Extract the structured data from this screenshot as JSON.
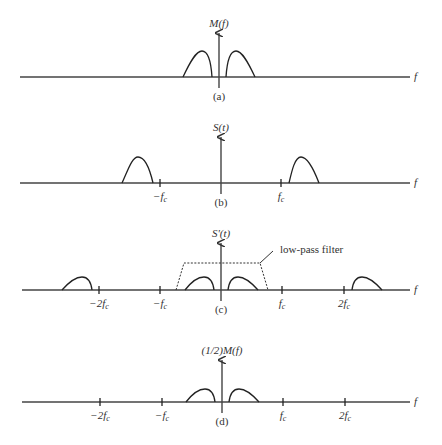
{
  "figure": {
    "panels": [
      {
        "id": "a",
        "caption": "(a)",
        "ylabel": "M(f)",
        "xlabel": "f",
        "ticks": []
      },
      {
        "id": "b",
        "caption": "(b)",
        "ylabel": "S(t)",
        "xlabel": "f",
        "ticks": [
          "−f",
          "f"
        ]
      },
      {
        "id": "c",
        "caption": "(c)",
        "ylabel": "S'(t)",
        "xlabel": "f",
        "ticks": [
          "−2f",
          "−f",
          "f",
          "2f"
        ],
        "annotation": "low-pass filter"
      },
      {
        "id": "d",
        "caption": "(d)",
        "ylabel": "(1/2)M(f)",
        "xlabel": "f",
        "ticks": [
          "−2f",
          "−f",
          "f",
          "2f"
        ]
      }
    ],
    "tick_subscript": "c"
  }
}
